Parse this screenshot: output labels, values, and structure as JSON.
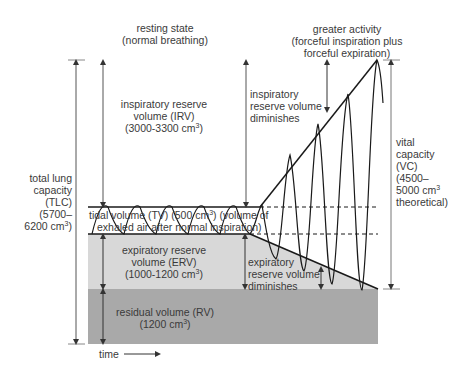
{
  "headings": {
    "resting_title_1": "resting state",
    "resting_title_2": "(normal breathing)",
    "activity_title_1": "greater activity",
    "activity_title_2": "(forceful inspiration plus",
    "activity_title_3": "forceful expiration)"
  },
  "irv": {
    "line1": "inspiratory reserve",
    "line2": "volume (IRV)",
    "line3_prefix": "(3000-3300 cm",
    "line3_sup": "3",
    "line3_suffix": ")"
  },
  "irv_diminishes": {
    "line1": "inspiratory",
    "line2": "reserve volume",
    "line3": "diminishes"
  },
  "tv": {
    "line1_prefix": "tidal volume (TV) (500 cm",
    "line1_sup": "3",
    "line1_suffix": ") (volume of",
    "line2": "exhaled air after normal inspiration)"
  },
  "erv": {
    "line1": "expiratory reserve",
    "line2": "volume (ERV)",
    "line3_prefix": "(1000-1200 cm",
    "line3_sup": "3",
    "line3_suffix": ")"
  },
  "erv_diminishes": {
    "line1": "expiratory",
    "line2": "reserve volume",
    "line3": "diminishes"
  },
  "rv": {
    "line1": "residual volume (RV)",
    "line2_prefix": "(1200 cm",
    "line2_sup": "3",
    "line2_suffix": ")"
  },
  "tlc": {
    "line1": "total lung",
    "line2": "capacity",
    "line3": "(TLC)",
    "line4": "(5700–",
    "line5_prefix": "6200 cm",
    "line5_sup": "3",
    "line5_suffix": ")"
  },
  "vc": {
    "line1": "vital",
    "line2": "capacity",
    "line3": "(VC)",
    "line4": "(4500–",
    "line5_prefix": "5000 cm",
    "line5_sup": "3",
    "line5_suffix": "",
    "line6": "theoretical)"
  },
  "axis": {
    "time_label": "time"
  },
  "colors": {
    "erv_fill": "#d8d8d8",
    "rv_fill": "#a9a9a9",
    "line": "#1a1a1a",
    "arrow": "#444444",
    "text": "#3a3a3a"
  }
}
